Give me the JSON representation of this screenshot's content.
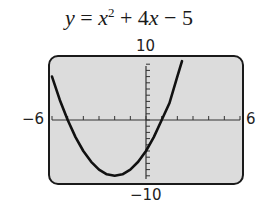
{
  "chart_data": {
    "type": "line",
    "title_parts": {
      "y": "y",
      "eq": " = ",
      "x": "x",
      "exp": "2",
      "rest": " + 4",
      "x2": "x",
      "tail": " − 5"
    },
    "xlabel": "",
    "ylabel": "",
    "xlim": [
      -6,
      6
    ],
    "ylim": [
      -10,
      10
    ],
    "xtick_step": 1,
    "ytick_step": 1,
    "grid": false,
    "legend": null,
    "tick_labels": {
      "xmin": "−6",
      "xmax": "6",
      "ymax": "10",
      "ymin": "−10"
    },
    "function": "x^2 + 4x - 5",
    "series": [
      {
        "name": "y = x^2 + 4x - 5",
        "x": [
          -6,
          -5.5,
          -5,
          -4.5,
          -4,
          -3.5,
          -3,
          -2.5,
          -2,
          -1.5,
          -1,
          -0.5,
          0,
          0.5,
          1,
          1.5,
          2,
          2.3
        ],
        "y": [
          7,
          3.25,
          0,
          -2.75,
          -5,
          -6.75,
          -8,
          -8.75,
          -9,
          -8.75,
          -8,
          -6.75,
          -5,
          -2.75,
          0,
          2.75,
          7,
          9.49
        ]
      }
    ],
    "colors": {
      "screen_bg": "#dcdcdc",
      "frame": "#1a1a1a",
      "curve": "#111111"
    }
  }
}
